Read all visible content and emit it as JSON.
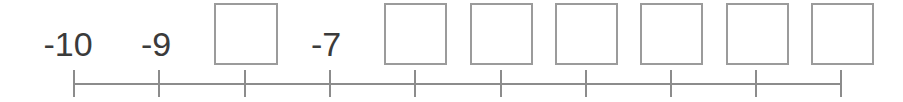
{
  "worksheet": {
    "type": "number-line-fill-in-the-blank",
    "width": 903,
    "height": 102,
    "colors": {
      "background": "#ffffff",
      "axis": "#8c8c8c",
      "tick": "#8c8c8c",
      "label_text": "#3b3b3b",
      "box_border": "#9b9b9b",
      "box_fill": "#ffffff"
    },
    "axis": {
      "line_y": 83,
      "line_x_start": 74,
      "line_x_end": 841,
      "tick_top": 70,
      "tick_bottom": 97,
      "tick_count": 10,
      "tick_spacing": 85.2,
      "tick_positions_x": [
        74,
        159,
        245,
        330,
        415,
        501,
        586,
        671,
        756,
        841
      ]
    },
    "tick_labels": [
      {
        "value": "-10",
        "tick_index": 0,
        "center_x": 68,
        "top": 27
      },
      {
        "value": "-9",
        "tick_index": 1,
        "center_x": 156,
        "top": 27
      },
      {
        "value": "-7",
        "tick_index": 3,
        "center_x": 326,
        "top": 27
      }
    ],
    "answer_boxes": [
      {
        "tick_index": 2,
        "left": 214,
        "top": 3,
        "width": 64,
        "height": 62
      },
      {
        "tick_index": 4,
        "left": 384,
        "top": 3,
        "width": 63,
        "height": 62
      },
      {
        "tick_index": 5,
        "left": 470,
        "top": 3,
        "width": 63,
        "height": 62
      },
      {
        "tick_index": 6,
        "left": 555,
        "top": 3,
        "width": 63,
        "height": 62
      },
      {
        "tick_index": 7,
        "left": 640,
        "top": 3,
        "width": 63,
        "height": 62
      },
      {
        "tick_index": 8,
        "left": 726,
        "top": 3,
        "width": 63,
        "height": 62
      },
      {
        "tick_index": 9,
        "left": 811,
        "top": 3,
        "width": 63,
        "height": 62
      }
    ]
  }
}
